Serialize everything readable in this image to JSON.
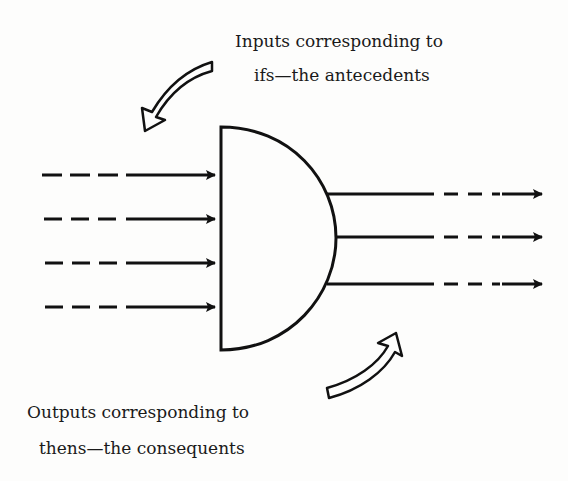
{
  "diagram": {
    "labels": {
      "inputs_line1": "Inputs corresponding to",
      "inputs_line2": "ifs—the antecedents",
      "outputs_line1": "Outputs corresponding to",
      "outputs_line2": "thens—the consequents"
    },
    "gate": {
      "shape": "d-shaped-gate",
      "input_count": 4,
      "output_count": 3
    },
    "input_arrows": [
      {
        "y": 174,
        "style": "dashed-then-solid"
      },
      {
        "y": 218,
        "style": "dashed-then-solid"
      },
      {
        "y": 262,
        "style": "dashed-then-solid"
      },
      {
        "y": 306,
        "style": "dashed-then-solid"
      }
    ],
    "output_arrows": [
      {
        "y": 194,
        "style": "solid-then-dashed"
      },
      {
        "y": 237,
        "style": "solid-then-dashed"
      },
      {
        "y": 284,
        "style": "solid-then-dashed"
      }
    ],
    "colors": {
      "ink": "#111111",
      "paper": "#fdfdfc"
    }
  }
}
